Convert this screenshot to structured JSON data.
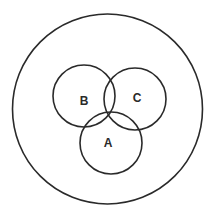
{
  "diagram": {
    "type": "venn",
    "universe": {
      "cx": 107.5,
      "cy": 109,
      "r": 95
    },
    "sets": [
      {
        "id": "A",
        "label": "A",
        "cx": 111,
        "cy": 143,
        "r": 31,
        "label_x": 108,
        "label_y": 143
      },
      {
        "id": "B",
        "label": "B",
        "cx": 84,
        "cy": 96,
        "r": 31,
        "label_x": 84,
        "label_y": 101
      },
      {
        "id": "C",
        "label": "C",
        "cx": 135,
        "cy": 99,
        "r": 31,
        "label_x": 137,
        "label_y": 98
      }
    ],
    "stroke_color": "#2a2a2a",
    "background_color": "#ffffff"
  }
}
